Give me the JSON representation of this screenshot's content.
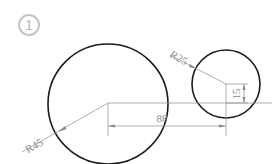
{
  "figure": {
    "label": "1",
    "colors": {
      "outline": "#1a1a1a",
      "dimension": "#9a9a9a",
      "badge": "#c0c0c0",
      "background": "#ffffff"
    },
    "shapes": {
      "large_circle": {
        "radius_label": "R45"
      },
      "small_circle": {
        "radius_label": "R25"
      }
    },
    "dimensions": {
      "horizontal_distance": "88",
      "vertical_offset": "15"
    }
  }
}
